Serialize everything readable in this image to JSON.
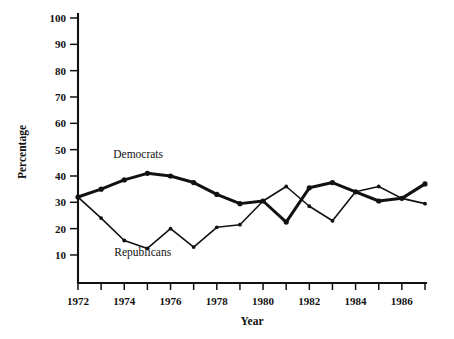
{
  "chart_data": {
    "type": "line",
    "title": "",
    "xlabel": "Year",
    "ylabel": "Percentage",
    "xlim": [
      1972,
      1987
    ],
    "ylim": [
      0,
      100
    ],
    "grid": false,
    "legend": "inline-labels",
    "x": [
      1972,
      1973,
      1974,
      1975,
      1976,
      1977,
      1978,
      1979,
      1980,
      1981,
      1982,
      1983,
      1984,
      1985,
      1986,
      1987
    ],
    "y_ticks": [
      10,
      20,
      30,
      40,
      50,
      60,
      70,
      80,
      90,
      100
    ],
    "y_tick_labels": [
      "10",
      "20",
      "30",
      "40",
      "50",
      "60",
      "70",
      "80",
      "90",
      "100"
    ],
    "x_ticks": [
      1972,
      1973,
      1974,
      1975,
      1976,
      1977,
      1978,
      1979,
      1980,
      1981,
      1982,
      1983,
      1984,
      1985,
      1986,
      1987
    ],
    "x_tick_labels": [
      "1972",
      "",
      "1974",
      "",
      "1976",
      "",
      "1978",
      "",
      "1980",
      "",
      "1982",
      "",
      "1984",
      "",
      "1986",
      ""
    ],
    "x_tick_labels_shown": [
      "1972",
      "1974",
      "1976",
      "1978",
      "1980",
      "1982",
      "1984",
      "1986"
    ],
    "series": [
      {
        "name": "Democrats",
        "values": [
          32,
          35,
          38.5,
          41,
          40,
          37.5,
          33,
          29.5,
          30.5,
          22.5,
          35.5,
          37.5,
          34,
          30.5,
          31.5,
          37
        ]
      },
      {
        "name": "Republicans",
        "values": [
          32,
          24,
          15.5,
          12.5,
          20,
          13,
          20.5,
          21.5,
          30.5,
          36,
          28.5,
          23,
          34,
          36,
          31.5,
          29.5
        ]
      }
    ],
    "annotations": [
      {
        "text": "Democrats",
        "x": 1974.6,
        "y": 47
      },
      {
        "text": "Republicans",
        "x": 1974.8,
        "y": 9.5
      }
    ],
    "colors": {
      "axis": "#111111",
      "democrats": "#111111",
      "republicans": "#111111",
      "background": "#ffffff"
    }
  }
}
